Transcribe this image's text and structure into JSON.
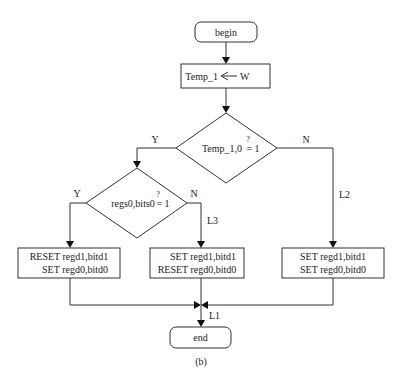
{
  "diagram": {
    "caption": "(b)",
    "nodes": {
      "begin": {
        "label": "begin"
      },
      "assign": {
        "label_left": "Temp_1",
        "arrow_symbol": "←",
        "label_right": "W"
      },
      "decision1": {
        "label": "Temp_1,0",
        "question": "?",
        "rhs": "= 1"
      },
      "decision2": {
        "label": "regs0,bits0",
        "question": "?",
        "rhs": "= 1"
      },
      "box_left": {
        "line1": "RESET regd1,bitd1",
        "line2": "SET regd0,bitd0"
      },
      "box_middle": {
        "line1": "SET regd1,bitd1",
        "line2": "RESET regd0,bitd0"
      },
      "box_right": {
        "line1": "SET regd1,bitd1",
        "line2": "SET regd0,bitd0"
      },
      "end": {
        "label": "end"
      }
    },
    "edge_labels": {
      "d1_yes": "Y",
      "d1_no": "N",
      "d2_yes": "Y",
      "d2_no": "N",
      "L1": "L1",
      "L2": "L2",
      "L3": "L3"
    }
  }
}
